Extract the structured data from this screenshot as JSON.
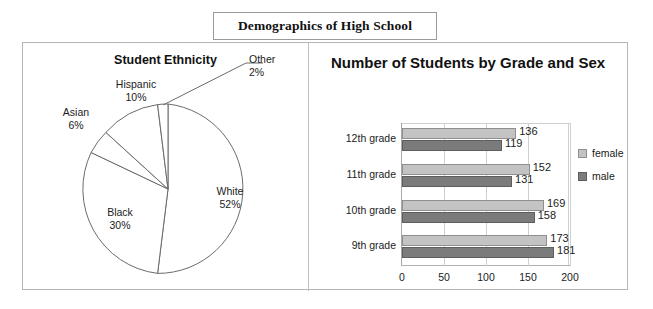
{
  "title": "Demographics of High School",
  "pie": {
    "title": "Student Ethnicity",
    "labels": {
      "other": "Other\n2%",
      "other_name": "Other",
      "other_pct": "2%",
      "hispanic_name": "Hispanic",
      "hispanic_pct": "10%",
      "asian_name": "Asian",
      "asian_pct": "6%",
      "black_name": "Black",
      "black_pct": "30%",
      "white_name": "White",
      "white_pct": "52%"
    }
  },
  "bar": {
    "title": "Number of Students by Grade and Sex",
    "legend": {
      "female": "female",
      "male": "male"
    }
  },
  "chart_data": [
    {
      "type": "pie",
      "title": "Student Ethnicity",
      "categories": [
        "White",
        "Black",
        "Hispanic",
        "Asian",
        "Other"
      ],
      "values": [
        52,
        30,
        10,
        6,
        2
      ],
      "value_unit": "%",
      "labels_shown": [
        "White 52%",
        "Black 30%",
        "Hispanic 10%",
        "Asian 6%",
        "Other 2%"
      ],
      "legend": "none",
      "slice_fill": "#ffffff",
      "slice_stroke": "#6b6b6b"
    },
    {
      "type": "bar",
      "orientation": "horizontal",
      "title": "Number of Students by Grade and Sex",
      "categories": [
        "12th grade",
        "11th grade",
        "10th grade",
        "9th grade"
      ],
      "series": [
        {
          "name": "female",
          "values": [
            136,
            152,
            169,
            173
          ],
          "color": "#c3c3c3"
        },
        {
          "name": "male",
          "values": [
            119,
            131,
            158,
            181
          ],
          "color": "#7b7b7b"
        }
      ],
      "xlabel": "",
      "ylabel": "",
      "xlim": [
        0,
        200
      ],
      "xticks": [
        0,
        50,
        100,
        150,
        200
      ],
      "grid": true,
      "legend_position": "right"
    }
  ]
}
